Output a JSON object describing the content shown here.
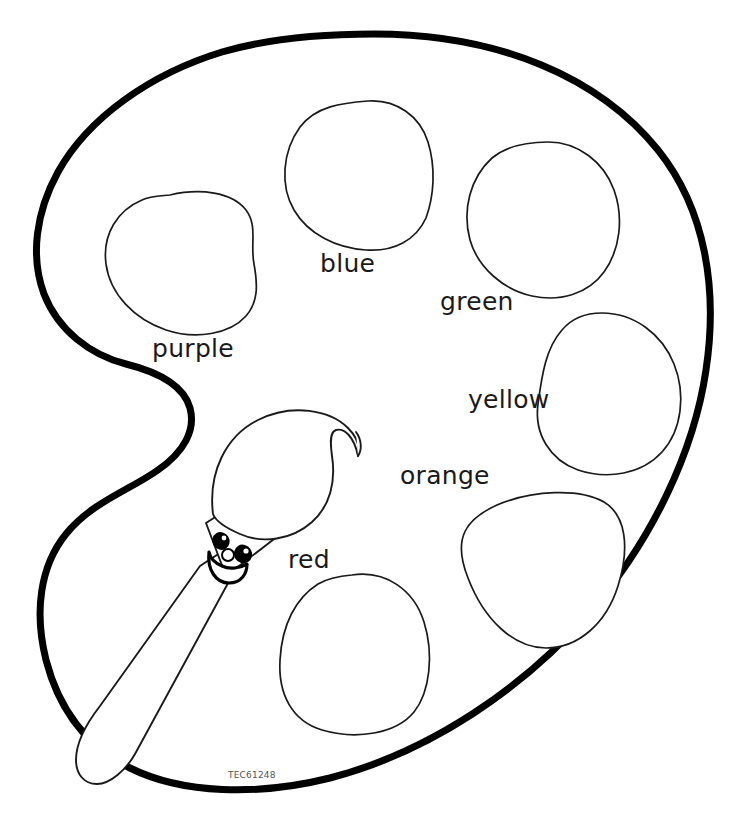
{
  "page": {
    "background_color": "#ffffff",
    "ink_color": "#000000",
    "width": 748,
    "height": 840
  },
  "artwork": {
    "subject": "artist paint palette with paintbrush",
    "style": "black and white line-art coloring page",
    "outline_color": "#000000",
    "well_outline_color": "#1a1a1a"
  },
  "labels": {
    "purple": "purple",
    "blue": "blue",
    "green": "green",
    "yellow": "yellow",
    "orange": "orange",
    "red": "red"
  },
  "wells": [
    {
      "name": "purple",
      "label": "purple",
      "label_x": 152,
      "label_y": 357
    },
    {
      "name": "blue",
      "label": "blue",
      "label_x": 320,
      "label_y": 272
    },
    {
      "name": "green",
      "label": "green",
      "label_x": 440,
      "label_y": 310
    },
    {
      "name": "yellow",
      "label": "yellow",
      "label_x": 468,
      "label_y": 408
    },
    {
      "name": "orange",
      "label": "orange",
      "label_x": 400,
      "label_y": 484
    },
    {
      "name": "red",
      "label": "red",
      "label_x": 288,
      "label_y": 568
    }
  ],
  "brush": {
    "name": "smiling-paintbrush",
    "has_face": true,
    "face_parts": [
      "left-eye",
      "right-eye",
      "nose",
      "smiling-mouth"
    ]
  },
  "watermark": {
    "code": "TEC61248",
    "x": 228,
    "y": 778
  }
}
